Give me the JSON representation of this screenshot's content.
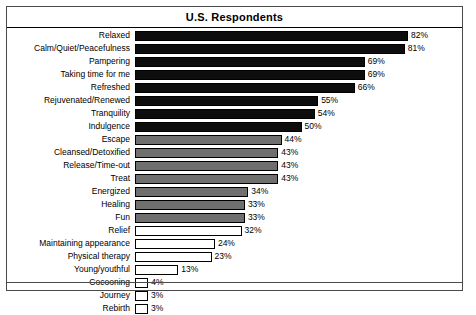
{
  "chart": {
    "title": "U.S. Respondents"
  },
  "chart_data": {
    "type": "bar",
    "orientation": "horizontal",
    "title": "U.S. Respondents",
    "xlabel": "",
    "ylabel": "",
    "xlim": [
      0,
      85
    ],
    "grid": false,
    "legend": "none",
    "value_suffix": "%",
    "categories": [
      "Relaxed",
      "Calm/Quiet/Peacefulness",
      "Pampering",
      "Taking time for me",
      "Refreshed",
      "Rejuvenated/Renewed",
      "Tranquility",
      "Indulgence",
      "Escape",
      "Cleansed/Detoxified",
      "Release/Time-out",
      "Treat",
      "Energized",
      "Healing",
      "Fun",
      "Relief",
      "Maintaining appearance",
      "Physical therapy",
      "Young/youthful",
      "Cocooning",
      "Journey",
      "Rebirth"
    ],
    "values": [
      82,
      81,
      69,
      69,
      66,
      55,
      54,
      50,
      44,
      43,
      43,
      43,
      34,
      33,
      33,
      32,
      24,
      23,
      13,
      4,
      3,
      3
    ],
    "labels": [
      "82%",
      "81%",
      "69%",
      "69%",
      "66%",
      "55%",
      "54%",
      "50%",
      "44%",
      "43%",
      "43%",
      "43%",
      "34%",
      "33%",
      "33%",
      "32%",
      "24%",
      "23%",
      "13%",
      "4%",
      "3%",
      "3%"
    ],
    "bar_styles": [
      "dark",
      "dark",
      "dark",
      "dark",
      "dark",
      "dark",
      "dark",
      "dark",
      "gray",
      "gray",
      "gray",
      "gray",
      "gray",
      "gray",
      "gray",
      "white",
      "white",
      "white",
      "white",
      "white",
      "white",
      "white"
    ],
    "colors": {
      "dark": "#0d0d0d",
      "gray": "#6f6f6f",
      "white": "#ffffff",
      "outline": "#000000",
      "frame": "#4a4a4a"
    }
  }
}
